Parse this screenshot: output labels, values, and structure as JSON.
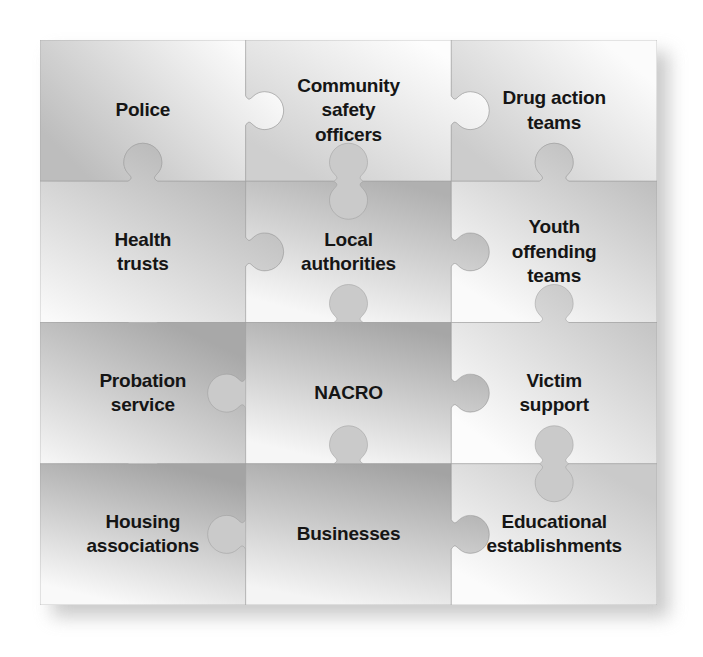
{
  "diagram": {
    "type": "jigsaw-grid",
    "columns": 3,
    "rows": 4,
    "background_color": "#ffffff",
    "text_color": "#151515",
    "palette": {
      "light": "#f3f3f3",
      "mid_light": "#dcdcdc",
      "mid": "#c4c4c4",
      "dark": "#a9a9a9",
      "outline": "#9a9a9a",
      "shadow": "#b9b9b9"
    },
    "pieces": [
      {
        "id": "police",
        "label": "Police",
        "row": 1,
        "col": 1,
        "grad_from": "#fbfbfb",
        "grad_to": "#bdbdbd",
        "grad_angle": 150,
        "edges": {
          "top": "flat",
          "right": "tab",
          "bottom": "blank",
          "left": "flat"
        }
      },
      {
        "id": "community-safety-officers",
        "label": "Community safety officers",
        "label_lines": [
          "Community",
          "safety",
          "officers"
        ],
        "row": 1,
        "col": 2,
        "grad_from": "#fdfdfd",
        "grad_to": "#cfcfcf",
        "grad_angle": 135,
        "edges": {
          "top": "flat",
          "right": "tab",
          "bottom": "blank",
          "left": "blank"
        }
      },
      {
        "id": "drug-action-teams",
        "label": "Drug action teams",
        "label_lines": [
          "Drug action",
          "teams"
        ],
        "row": 1,
        "col": 3,
        "grad_from": "#fbfbfb",
        "grad_to": "#cccccc",
        "grad_angle": 140,
        "edges": {
          "top": "flat",
          "right": "flat",
          "bottom": "blank",
          "left": "blank"
        }
      },
      {
        "id": "health-trusts",
        "label": "Health trusts",
        "label_lines": [
          "Health",
          "trusts"
        ],
        "row": 2,
        "col": 1,
        "grad_from": "#b5b5b5",
        "grad_to": "#fafafa",
        "grad_angle": 120,
        "edges": {
          "top": "tab",
          "right": "tab",
          "bottom": "tab",
          "left": "flat"
        }
      },
      {
        "id": "local-authorities",
        "label": "Local authorities",
        "label_lines": [
          "Local",
          "authorities"
        ],
        "row": 2,
        "col": 2,
        "grad_from": "#b0b0b0",
        "grad_to": "#f7f7f7",
        "grad_angle": 115,
        "edges": {
          "top": "blank",
          "right": "tab",
          "bottom": "blank",
          "left": "blank"
        }
      },
      {
        "id": "youth-offending-teams",
        "label": "Youth offending teams",
        "label_lines": [
          "Youth",
          "offending",
          "teams"
        ],
        "row": 2,
        "col": 3,
        "grad_from": "#bfbfbf",
        "grad_to": "#fafafa",
        "grad_angle": 125,
        "edges": {
          "top": "tab",
          "right": "flat",
          "bottom": "flat",
          "left": "blank"
        }
      },
      {
        "id": "probation-service",
        "label": "Probation service",
        "label_lines": [
          "Probation",
          "service"
        ],
        "row": 3,
        "col": 1,
        "grad_from": "#a8a8a8",
        "grad_to": "#f8f8f8",
        "grad_angle": 118,
        "edges": {
          "top": "flat",
          "right": "blank",
          "bottom": "tab",
          "left": "flat"
        }
      },
      {
        "id": "nacro",
        "label": "NACRO",
        "row": 3,
        "col": 2,
        "grad_from": "#a6a6a6",
        "grad_to": "#f6f6f6",
        "grad_angle": 112,
        "edges": {
          "top": "flat",
          "right": "tab",
          "bottom": "blank",
          "left": "flat"
        }
      },
      {
        "id": "victim-support",
        "label": "Victim support",
        "label_lines": [
          "Victim",
          "support"
        ],
        "row": 3,
        "col": 3,
        "grad_from": "#c6c6c6",
        "grad_to": "#fcfcfc",
        "grad_angle": 130,
        "edges": {
          "top": "tab",
          "right": "flat",
          "bottom": "blank",
          "left": "blank"
        }
      },
      {
        "id": "housing-associations",
        "label": "Housing associations",
        "label_lines": [
          "Housing",
          "associations"
        ],
        "row": 4,
        "col": 1,
        "grad_from": "#a4a4a4",
        "grad_to": "#f9f9f9",
        "grad_angle": 110,
        "edges": {
          "top": "flat",
          "right": "blank",
          "bottom": "flat",
          "left": "flat"
        }
      },
      {
        "id": "businesses",
        "label": "Businesses",
        "row": 4,
        "col": 2,
        "grad_from": "#a3a3a3",
        "grad_to": "#f4f4f4",
        "grad_angle": 108,
        "edges": {
          "top": "flat",
          "right": "tab",
          "bottom": "flat",
          "left": "flat"
        }
      },
      {
        "id": "educational-establishments",
        "label": "Educational establishments",
        "label_lines": [
          "Educational",
          "establishments"
        ],
        "row": 4,
        "col": 3,
        "grad_from": "#cacaca",
        "grad_to": "#fbfbfb",
        "grad_angle": 128,
        "edges": {
          "top": "blank",
          "right": "flat",
          "bottom": "flat",
          "left": "blank"
        }
      }
    ]
  }
}
